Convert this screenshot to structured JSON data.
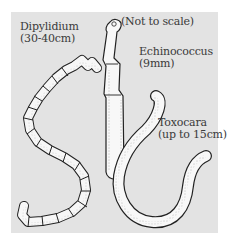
{
  "figure": {
    "note": "(Not to scale)",
    "worms": [
      {
        "name": "Dipylidium",
        "size": "(30-40cm)"
      },
      {
        "name": "Echinococcus",
        "size": "(9mm)"
      },
      {
        "name": "Toxocara",
        "size": "(up to 15cm)"
      }
    ],
    "colors": {
      "panel": "#e3e3e3",
      "ink": "#222222",
      "worm_fill": "#fafafa",
      "text": "#3a3a3a"
    }
  }
}
